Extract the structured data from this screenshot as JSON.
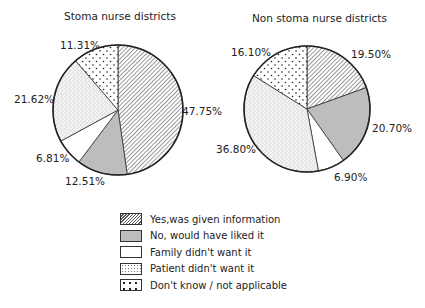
{
  "chart_data": [
    {
      "type": "pie",
      "title": "Stoma nurse districts",
      "categories": [
        "Yes,was given information",
        "No, would have liked it",
        "Family didn't want it",
        "Patient didn't want it",
        "Don't know / not applicable"
      ],
      "values": [
        47.75,
        12.51,
        6.81,
        21.62,
        11.31
      ],
      "labels": [
        "47.75%",
        "12.51%",
        "6.81%",
        "21.62%",
        "11.31%"
      ]
    },
    {
      "type": "pie",
      "title": "Non stoma nurse districts",
      "categories": [
        "Yes,was given information",
        "No, would have liked it",
        "Family didn't want it",
        "Patient didn't want it",
        "Don't know / not applicable"
      ],
      "values": [
        19.5,
        20.7,
        6.9,
        36.8,
        16.1
      ],
      "labels": [
        "19.50%",
        "20.70%",
        "6.90%",
        "36.80%",
        "16.10%"
      ]
    }
  ],
  "charts": {
    "left": {
      "title": "Stoma nurse districts",
      "l0": "47.75%",
      "l1": "12.51%",
      "l2": "6.81%",
      "l3": "21.62%",
      "l4": "11.31%"
    },
    "right": {
      "title": "Non stoma nurse districts",
      "l0": "19.50%",
      "l1": "20.70%",
      "l2": "6.90%",
      "l3": "36.80%",
      "l4": "16.10%"
    }
  },
  "legend": [
    {
      "label": "Yes,was given information",
      "pattern": "hatch"
    },
    {
      "label": "No, would have liked it",
      "pattern": "grey"
    },
    {
      "label": "Family didn't want it",
      "pattern": "white"
    },
    {
      "label": "Patient didn't want it",
      "pattern": "stipple"
    },
    {
      "label": "Don't know / not applicable",
      "pattern": "dots"
    }
  ],
  "colors": {
    "grey_fill": "#bdbdbd",
    "outline": "#222222"
  }
}
